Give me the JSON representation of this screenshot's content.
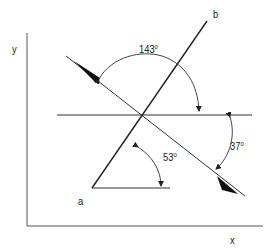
{
  "diagram": {
    "type": "vector-angle-diagram",
    "axes": {
      "x_label": "x",
      "y_label": "y"
    },
    "points": {
      "a_label": "a",
      "b_label": "b"
    },
    "angles": [
      {
        "id": "angle-143",
        "value": "143",
        "unit": "o",
        "description": "angle from arrow line (upper-left) to horizontal (right side)"
      },
      {
        "id": "angle-37",
        "value": "37",
        "unit": "o",
        "description": "angle between horizontal (right) and arrow line (lower-right)"
      },
      {
        "id": "angle-53",
        "value": "53",
        "unit": "o",
        "description": "angle between line a-b and horizontal base at a"
      }
    ],
    "colors": {
      "line": "#222222",
      "background": "#ffffff"
    }
  }
}
